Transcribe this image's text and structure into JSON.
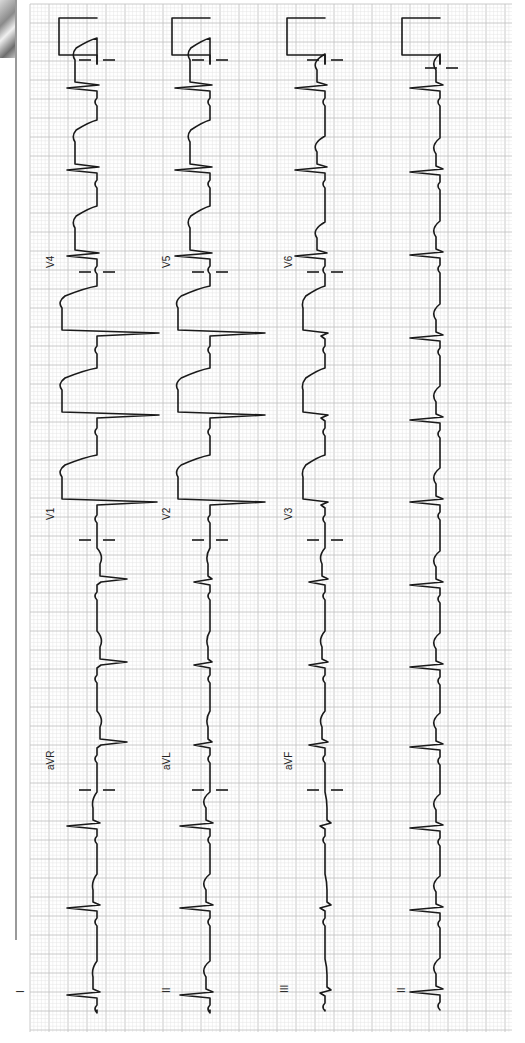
{
  "grid": {
    "x0": 30,
    "x1": 512,
    "y0": 4,
    "y1": 1032,
    "minor_px": 3.8,
    "major_px": 19,
    "minor_color": "#e4e4e4",
    "major_color": "#c4c4c4"
  },
  "chart_data": {
    "type": "line",
    "orientation": "rotated 90° CCW; time runs bottom→top, positive deflection points left",
    "paper": {
      "speed_mm_s": 25,
      "gain_mm_mV": 10,
      "calibration_pulse_mV": 1
    },
    "rows": [
      {
        "name": "row-1",
        "baseline_x": 97,
        "leads": [
          "I",
          "aVR",
          "V1",
          "V4"
        ]
      },
      {
        "name": "row-2",
        "baseline_x": 210,
        "leads": [
          "II",
          "aVL",
          "V2",
          "V5"
        ]
      },
      {
        "name": "row-3",
        "baseline_x": 325,
        "leads": [
          "III",
          "aVF",
          "V3",
          "V6"
        ]
      },
      {
        "name": "rhythm",
        "baseline_x": 440,
        "leads": [
          "II"
        ]
      }
    ],
    "lead_separators_y": [
      790,
      540,
      272
    ],
    "beat_y": [
      992,
      910,
      828,
      747,
      667,
      585,
      502,
      420,
      338,
      255,
      172,
      88
    ],
    "heart_rate_bpm_est": 90,
    "rhythm": "regular sinus",
    "interpretation_visible_features": "marked ST elevation (tombstoning) in V1–V5, smaller in V6 and I/aVL; QS complexes V1–V3"
  },
  "labels": [
    {
      "text": "I",
      "x": 24,
      "y": 993
    },
    {
      "text": "II",
      "x": 170,
      "y": 993
    },
    {
      "text": "III",
      "x": 288,
      "y": 993
    },
    {
      "text": "II",
      "x": 405,
      "y": 993
    },
    {
      "text": "aVR",
      "x": 54,
      "y": 770
    },
    {
      "text": "aVL",
      "x": 170,
      "y": 770
    },
    {
      "text": "aVF",
      "x": 292,
      "y": 770
    },
    {
      "text": "V1",
      "x": 54,
      "y": 520
    },
    {
      "text": "V2",
      "x": 170,
      "y": 520
    },
    {
      "text": "V3",
      "x": 292,
      "y": 520
    },
    {
      "text": "V4",
      "x": 54,
      "y": 268
    },
    {
      "text": "V5",
      "x": 170,
      "y": 268
    },
    {
      "text": "V6",
      "x": 292,
      "y": 268
    }
  ],
  "beats": {
    "row-1": [
      {
        "lead": "I",
        "y": 995,
        "r": -30,
        "s": 3,
        "st": -4,
        "t": -6
      },
      {
        "lead": "I",
        "y": 908,
        "r": -30,
        "s": 3,
        "st": -4,
        "t": -6
      },
      {
        "lead": "I",
        "y": 826,
        "r": -30,
        "s": 3,
        "st": -4,
        "t": -6
      },
      {
        "lead": "aVR",
        "y": 745,
        "r": 4,
        "s": 30,
        "st": 3,
        "t": 7
      },
      {
        "lead": "aVR",
        "y": 665,
        "r": 4,
        "s": 30,
        "st": 3,
        "t": 7
      },
      {
        "lead": "aVR",
        "y": 582,
        "r": 4,
        "s": 30,
        "st": 3,
        "t": 7
      },
      {
        "lead": "V1",
        "y": 505,
        "r": 0,
        "s": 60,
        "st": -35,
        "t": -40,
        "tomb": true
      },
      {
        "lead": "V1",
        "y": 418,
        "r": 0,
        "s": 62,
        "st": -35,
        "t": -40,
        "tomb": true
      },
      {
        "lead": "V1",
        "y": 336,
        "r": 0,
        "s": 62,
        "st": -35,
        "t": -40,
        "tomb": true
      },
      {
        "lead": "V4",
        "y": 256,
        "r": -30,
        "s": 2,
        "st": -22,
        "t": -26,
        "tomb": true
      },
      {
        "lead": "V4",
        "y": 170,
        "r": -30,
        "s": 2,
        "st": -22,
        "t": -26,
        "tomb": true
      },
      {
        "lead": "V4",
        "y": 88,
        "r": -30,
        "s": 2,
        "st": -22,
        "t": -26,
        "tomb": true
      }
    ],
    "row-2": [
      {
        "lead": "II",
        "y": 995,
        "r": -30,
        "s": 3,
        "st": -4,
        "t": -10
      },
      {
        "lead": "II",
        "y": 908,
        "r": -30,
        "s": 3,
        "st": -4,
        "t": -10
      },
      {
        "lead": "II",
        "y": 826,
        "r": -30,
        "s": 3,
        "st": -4,
        "t": -10
      },
      {
        "lead": "aVL",
        "y": 745,
        "r": -16,
        "s": 2,
        "st": -2,
        "t": -5
      },
      {
        "lead": "aVL",
        "y": 665,
        "r": -16,
        "s": 2,
        "st": -2,
        "t": -5
      },
      {
        "lead": "aVL",
        "y": 582,
        "r": -16,
        "s": 2,
        "st": -2,
        "t": -5
      },
      {
        "lead": "V2",
        "y": 505,
        "r": 0,
        "s": 55,
        "st": -32,
        "t": -36,
        "tomb": true
      },
      {
        "lead": "V2",
        "y": 418,
        "r": 0,
        "s": 55,
        "st": -32,
        "t": -36,
        "tomb": true
      },
      {
        "lead": "V2",
        "y": 336,
        "r": 0,
        "s": 55,
        "st": -32,
        "t": -36,
        "tomb": true
      },
      {
        "lead": "V5",
        "y": 256,
        "r": -35,
        "s": 2,
        "st": -20,
        "t": -24,
        "tomb": true
      },
      {
        "lead": "V5",
        "y": 170,
        "r": -35,
        "s": 2,
        "st": -20,
        "t": -24,
        "tomb": true
      },
      {
        "lead": "V5",
        "y": 88,
        "r": -35,
        "s": 2,
        "st": -20,
        "t": -24,
        "tomb": true
      }
    ],
    "row-3": [
      {
        "lead": "III",
        "y": 993,
        "r": -5,
        "s": 6,
        "st": 2,
        "t": 2
      },
      {
        "lead": "III",
        "y": 908,
        "r": -5,
        "s": 6,
        "st": 2,
        "t": 2
      },
      {
        "lead": "III",
        "y": 826,
        "r": -5,
        "s": 6,
        "st": 2,
        "t": 2
      },
      {
        "lead": "aVF",
        "y": 745,
        "r": -16,
        "s": 3,
        "st": -3,
        "t": -7
      },
      {
        "lead": "aVF",
        "y": 665,
        "r": -16,
        "s": 3,
        "st": -3,
        "t": -7
      },
      {
        "lead": "aVF",
        "y": 582,
        "r": -16,
        "s": 3,
        "st": -3,
        "t": -7
      },
      {
        "lead": "V3",
        "y": 505,
        "r": -4,
        "s": 3,
        "st": -22,
        "t": -24,
        "tomb": true
      },
      {
        "lead": "V3",
        "y": 418,
        "r": -4,
        "s": 3,
        "st": -22,
        "t": -24,
        "tomb": true
      },
      {
        "lead": "V3",
        "y": 336,
        "r": -4,
        "s": 3,
        "st": -22,
        "t": -24,
        "tomb": true
      },
      {
        "lead": "V6",
        "y": 256,
        "r": -30,
        "s": 2,
        "st": -8,
        "t": -14
      },
      {
        "lead": "V6",
        "y": 170,
        "r": -30,
        "s": 2,
        "st": -8,
        "t": -14
      },
      {
        "lead": "V6",
        "y": 88,
        "r": -30,
        "s": 2,
        "st": -8,
        "t": -14
      }
    ],
    "rhythm": [
      {
        "lead": "II",
        "y": 992,
        "r": -30,
        "s": 3,
        "st": -4,
        "t": -10
      },
      {
        "lead": "II",
        "y": 910,
        "r": -30,
        "s": 3,
        "st": -4,
        "t": -10
      },
      {
        "lead": "II",
        "y": 828,
        "r": -30,
        "s": 3,
        "st": -4,
        "t": -10
      },
      {
        "lead": "II",
        "y": 747,
        "r": -30,
        "s": 3,
        "st": -4,
        "t": -10
      },
      {
        "lead": "II",
        "y": 667,
        "r": -30,
        "s": 3,
        "st": -4,
        "t": -10
      },
      {
        "lead": "II",
        "y": 585,
        "r": -30,
        "s": 3,
        "st": -4,
        "t": -10
      },
      {
        "lead": "II",
        "y": 502,
        "r": -30,
        "s": 3,
        "st": -4,
        "t": -10
      },
      {
        "lead": "II",
        "y": 420,
        "r": -30,
        "s": 3,
        "st": -4,
        "t": -10
      },
      {
        "lead": "II",
        "y": 338,
        "r": -30,
        "s": 3,
        "st": -4,
        "t": -10
      },
      {
        "lead": "II",
        "y": 255,
        "r": -30,
        "s": 3,
        "st": -4,
        "t": -10
      },
      {
        "lead": "II",
        "y": 172,
        "r": -30,
        "s": 3,
        "st": -4,
        "t": -10
      },
      {
        "lead": "II",
        "y": 88,
        "r": -30,
        "s": 3,
        "st": -4,
        "t": -10
      }
    ]
  },
  "calibration": {
    "y_bottom": 55,
    "y_top": 18,
    "width": 38
  }
}
